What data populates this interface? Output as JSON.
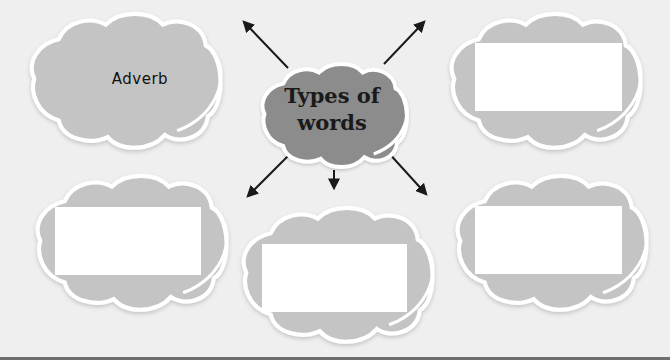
{
  "diagram": {
    "type": "concept-map",
    "center": {
      "label_line1": "Types of",
      "label_line2": "words"
    },
    "nodes": [
      {
        "id": "top-left",
        "label": "Adverb",
        "filled": true
      },
      {
        "id": "top-right",
        "label": "",
        "filled": false
      },
      {
        "id": "bottom-left",
        "label": "",
        "filled": false
      },
      {
        "id": "bottom-center",
        "label": "",
        "filled": false
      },
      {
        "id": "bottom-right",
        "label": "",
        "filled": false
      }
    ],
    "arrows": [
      {
        "from": "center",
        "to": "top-left"
      },
      {
        "from": "center",
        "to": "top-right"
      },
      {
        "from": "center",
        "to": "bottom-left"
      },
      {
        "from": "center",
        "to": "bottom-center"
      },
      {
        "from": "center",
        "to": "bottom-right"
      }
    ]
  },
  "colors": {
    "background": "#efefef",
    "outer_cloud": "#c4c4c4",
    "center_cloud": "#8c8c8c",
    "outline": "#ffffff",
    "arrow": "#1a1a1a",
    "answer_box": "#ffffff"
  }
}
